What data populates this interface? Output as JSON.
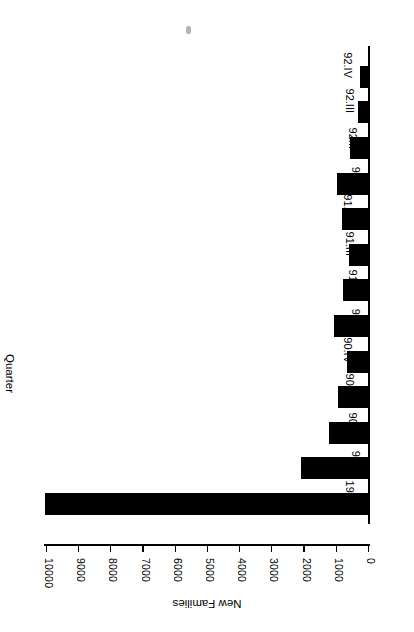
{
  "chart_data": {
    "type": "bar",
    "orientation": "horizontal",
    "title": "",
    "xlabel": "New Families",
    "ylabel": "Quarter",
    "categories": [
      "1989",
      "90.I",
      "90.II",
      "90.III",
      "90.IV",
      "91.I",
      "91.II",
      "91.III",
      "91.IV",
      "92.I",
      "92.II",
      "92.III",
      "92.IV"
    ],
    "values": [
      10050,
      2100,
      1250,
      950,
      680,
      1100,
      800,
      620,
      830,
      1000,
      580,
      330,
      280
    ],
    "value_axis_ticks": [
      0,
      1000,
      2000,
      3000,
      4000,
      5000,
      6000,
      7000,
      8000,
      9000,
      10000
    ],
    "value_axis_tick_labels": [
      "0",
      "1000",
      "2000",
      "3000",
      "4000",
      "5000",
      "6000",
      "7000",
      "8000",
      "9000",
      "10000"
    ],
    "xlim": [
      0,
      10100
    ],
    "grid": false,
    "legend": false,
    "bar_color": "#000000",
    "background_color": "#ffffff",
    "rotation_degrees": 180
  },
  "figure": {
    "value_axis_title": "New Families",
    "category_axis_title": "Quarter",
    "artifact_label": "scan-speck"
  }
}
